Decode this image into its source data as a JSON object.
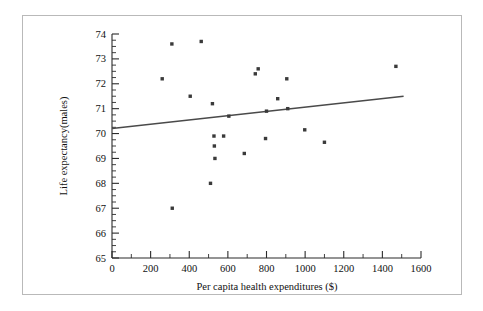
{
  "chart_data": {
    "type": "scatter",
    "title": "",
    "xlabel": "Per capita health expenditures ($)",
    "ylabel": "Life expectancy(males)",
    "xlim": [
      0,
      1600
    ],
    "ylim": [
      65,
      74
    ],
    "x_major_ticks": [
      0,
      200,
      400,
      600,
      800,
      1000,
      1200,
      1400,
      1600
    ],
    "x_tick_labels": [
      "0",
      "200",
      "400",
      "600",
      "800",
      "1000",
      "1200",
      "1400",
      "1600"
    ],
    "x_minor_step": 100,
    "y_major_ticks": [
      65,
      66,
      67,
      68,
      69,
      70,
      71,
      72,
      73,
      74
    ],
    "y_tick_labels": [
      "65",
      "66",
      "67",
      "68",
      "69",
      "70",
      "71",
      "72",
      "73",
      "74"
    ],
    "y_minor_step": 0.25,
    "grid": false,
    "legend": false,
    "marker_color": "#3a3a3a",
    "line_color": "#4a4a4a",
    "points": [
      {
        "x": 260,
        "y": 72.2
      },
      {
        "x": 310,
        "y": 73.6
      },
      {
        "x": 312,
        "y": 67.0
      },
      {
        "x": 405,
        "y": 71.5
      },
      {
        "x": 462,
        "y": 73.7
      },
      {
        "x": 510,
        "y": 68.0
      },
      {
        "x": 520,
        "y": 71.2
      },
      {
        "x": 528,
        "y": 69.9
      },
      {
        "x": 530,
        "y": 69.5
      },
      {
        "x": 533,
        "y": 69.0
      },
      {
        "x": 578,
        "y": 69.9
      },
      {
        "x": 605,
        "y": 70.7
      },
      {
        "x": 685,
        "y": 69.2
      },
      {
        "x": 742,
        "y": 72.4
      },
      {
        "x": 757,
        "y": 72.6
      },
      {
        "x": 795,
        "y": 69.8
      },
      {
        "x": 800,
        "y": 70.9
      },
      {
        "x": 858,
        "y": 71.4
      },
      {
        "x": 905,
        "y": 72.2
      },
      {
        "x": 910,
        "y": 71.0
      },
      {
        "x": 998,
        "y": 70.15
      },
      {
        "x": 1100,
        "y": 69.65
      },
      {
        "x": 1470,
        "y": 72.7
      }
    ],
    "trend_line": {
      "x_start": 0,
      "y_start": 70.2,
      "x_end": 1510,
      "y_end": 71.5
    }
  }
}
